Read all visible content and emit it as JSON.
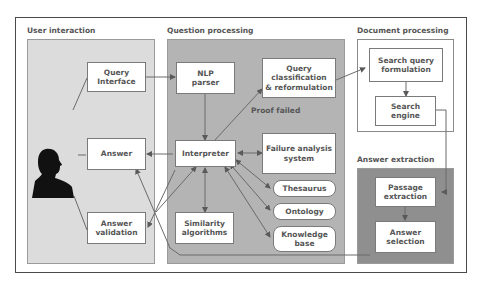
{
  "sections": {
    "user_interaction": "User interaction",
    "question_processing": "Question processing",
    "document_processing": "Document processing",
    "answer_extraction": "Answer extraction"
  },
  "nodes": {
    "query_interface": "Query\nInterface",
    "answer": "Answer",
    "answer_validation": "Answer\nvalidation",
    "nlp_parser": "NLP\nparser",
    "query_classification": "Query\nclassification\n& reformulation",
    "interpreter": "Interpreter",
    "failure_analysis": "Failure analysis\nsystem",
    "thesaurus": "Thesaurus",
    "ontology": "Ontology",
    "knowledge_base": "Knowledge\nbase",
    "similarity_algorithms": "Similarity\nalgorithms",
    "search_query_formulation": "Search query\nformulation",
    "search_engine": "Search\nengine",
    "passage_extraction": "Passage\nextraction",
    "answer_selection": "Answer\nselection"
  },
  "labels": {
    "proof_failed": "Proof failed"
  },
  "icons": {
    "user": "person-silhouette-icon"
  },
  "colors": {
    "user_panel": "#dcdcdc",
    "question_panel": "#b4b4b4",
    "answer_panel": "#8f8f8f",
    "line": "#6a6a6a"
  }
}
